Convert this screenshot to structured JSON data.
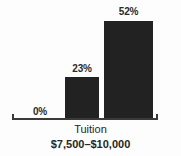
{
  "chart_data": {
    "type": "bar",
    "title": "Tuition",
    "subtitle": "$7,500–$10,000",
    "xlabel": "",
    "ylabel": "",
    "ylim": [
      0,
      60
    ],
    "grid": false,
    "legend": null,
    "categories": [
      "",
      "",
      ""
    ],
    "values": [
      0,
      23,
      52
    ],
    "data_labels": [
      "0%",
      "23%",
      "52%"
    ],
    "series": [
      {
        "name": "Tuition",
        "values": [
          0,
          23,
          52
        ]
      }
    ],
    "colors": {
      "bar_fill": "#222222",
      "axis": "#3a3a3a",
      "text": "#262626",
      "background": "#fdfdfd"
    }
  },
  "bars": [
    {
      "label": "0%",
      "value": 0,
      "left": 18,
      "width": 44,
      "height": 0,
      "label_left": 18,
      "label_width": 44,
      "label_top": 106
    },
    {
      "label": "23%",
      "value": 23,
      "left": 65,
      "width": 34,
      "height": 43,
      "label_left": 63,
      "label_width": 38,
      "label_top": 63
    },
    {
      "label": "52%",
      "value": 52,
      "left": 104,
      "width": 49,
      "height": 99,
      "label_left": 104,
      "label_width": 49,
      "label_top": 6
    }
  ],
  "axis": {
    "left_cap": "axis-end-cap-left",
    "right_cap": "axis-end-cap-right"
  }
}
